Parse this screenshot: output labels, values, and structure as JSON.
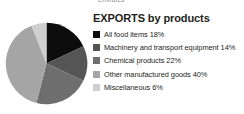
{
  "caption": {
    "clipped_text": "Emirates"
  },
  "legend": {
    "title": "EXPORTS by products",
    "items": [
      {
        "label": "All food items 18%",
        "color": "#0d0d0d"
      },
      {
        "label": "Machinery and transport equipment 14%",
        "color": "#555555"
      },
      {
        "label": "Chemical products 22%",
        "color": "#6e6e6e"
      },
      {
        "label": "Other manufactured goods 40%",
        "color": "#a5a5a5"
      },
      {
        "label": "Miscellaneous 6%",
        "color": "#cfcfcf"
      }
    ]
  },
  "chart_data": {
    "type": "pie",
    "title": "EXPORTS by products",
    "subtitle": "",
    "xlabel": "",
    "ylabel": "",
    "legend_position": "right",
    "grid": false,
    "start_angle_deg": 0,
    "direction": "clockwise",
    "units": "percent",
    "categories": [
      "All food items",
      "Machinery and transport equipment",
      "Chemical products",
      "Other manufactured goods",
      "Miscellaneous"
    ],
    "values": [
      18,
      14,
      22,
      40,
      6
    ],
    "value_labels": [
      "18%",
      "14%",
      "22%",
      "40%",
      "6%"
    ],
    "colors": [
      "#0d0d0d",
      "#555555",
      "#6e6e6e",
      "#a5a5a5",
      "#cfcfcf"
    ],
    "total": 100
  }
}
